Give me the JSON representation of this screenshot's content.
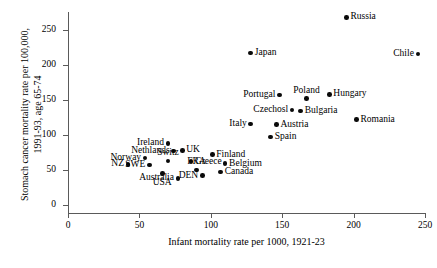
{
  "chart_data": {
    "type": "scatter",
    "title": "",
    "xlabel": "Infant mortality rate per 1000, 1921-23",
    "ylabel_line1": "Stomach cancer mortality rate per 100,000,",
    "ylabel_line2": "1991-93, age 65-74",
    "xlim": [
      0,
      250
    ],
    "ylim": [
      0,
      265
    ],
    "xticks": [
      0,
      50,
      100,
      150,
      200,
      250
    ],
    "yticks": [
      0,
      50,
      100,
      150,
      200,
      250
    ],
    "grid": false,
    "legend": "none",
    "points": [
      {
        "label": "Russia",
        "x": 195,
        "y": 268,
        "label_pos": "right"
      },
      {
        "label": "Japan",
        "x": 128,
        "y": 217,
        "label_pos": "right"
      },
      {
        "label": "Chile",
        "x": 245,
        "y": 216,
        "label_pos": "left"
      },
      {
        "label": "Poland",
        "x": 167,
        "y": 152,
        "label_pos": "above"
      },
      {
        "label": "Hungary",
        "x": 183,
        "y": 158,
        "label_pos": "right"
      },
      {
        "label": "Portugal",
        "x": 148,
        "y": 157,
        "label_pos": "left"
      },
      {
        "label": "Bulgaria",
        "x": 163,
        "y": 134,
        "label_pos": "right"
      },
      {
        "label": "Romania",
        "x": 202,
        "y": 122,
        "label_pos": "right"
      },
      {
        "label": "Czechosl",
        "x": 157,
        "y": 136,
        "label_pos": "left"
      },
      {
        "label": "Austria",
        "x": 146,
        "y": 115,
        "label_pos": "right"
      },
      {
        "label": "Italy",
        "x": 128,
        "y": 116,
        "label_pos": "left"
      },
      {
        "label": "Spain",
        "x": 142,
        "y": 97,
        "label_pos": "right"
      },
      {
        "label": "Ireland",
        "x": 70,
        "y": 88,
        "label_pos": "left"
      },
      {
        "label": "UK",
        "x": 80,
        "y": 78,
        "label_pos": "right"
      },
      {
        "label": "Nethlands",
        "x": 74,
        "y": 77,
        "label_pos": "left"
      },
      {
        "label": "Finland",
        "x": 101,
        "y": 72,
        "label_pos": "right"
      },
      {
        "label": "Norway",
        "x": 54,
        "y": 67,
        "label_pos": "left"
      },
      {
        "label": "Switz",
        "x": 70,
        "y": 63,
        "label_pos": "above"
      },
      {
        "label": "Greece",
        "x": 86,
        "y": 62,
        "label_pos": "right"
      },
      {
        "label": "Belgium",
        "x": 110,
        "y": 59,
        "label_pos": "right"
      },
      {
        "label": "NZ",
        "x": 42,
        "y": 58,
        "label_pos": "left"
      },
      {
        "label": "SWE",
        "x": 57,
        "y": 57,
        "label_pos": "left"
      },
      {
        "label": "FRA",
        "x": 90,
        "y": 50,
        "label_pos": "above"
      },
      {
        "label": "Canada",
        "x": 107,
        "y": 47,
        "label_pos": "right"
      },
      {
        "label": "DEN",
        "x": 94,
        "y": 42,
        "label_pos": "left"
      },
      {
        "label": "Australia",
        "x": 77,
        "y": 38,
        "label_pos": "left"
      },
      {
        "label": "USA",
        "x": 66,
        "y": 45,
        "label_pos": "below"
      }
    ]
  }
}
